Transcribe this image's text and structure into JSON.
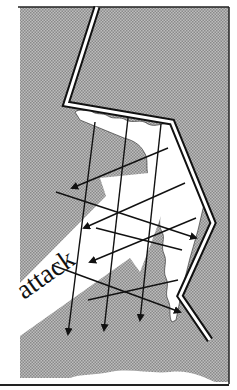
{
  "diagram": {
    "label": "attack",
    "colors": {
      "background": "#ffffff",
      "terrain": "#a9a9a9",
      "ink": "#111111",
      "attack_band": "#ffffff"
    }
  }
}
